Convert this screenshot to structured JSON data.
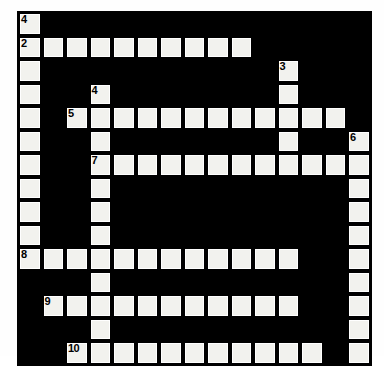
{
  "puzzle": {
    "title": "Crossword Grid",
    "rows": 15,
    "cols": 15,
    "cell_size_px": 23.5,
    "colors": {
      "block": "#000000",
      "open": "#f2f2ee",
      "page_background": "#ffffff",
      "number_text": "#000000"
    },
    "clue_numbers_visible": [
      "4",
      "2",
      "3",
      "4",
      "5",
      "6",
      "7",
      "8",
      "9",
      "10"
    ],
    "grid": [
      [
        {
          "type": "open",
          "number": "4"
        },
        {
          "type": "block"
        },
        {
          "type": "block"
        },
        {
          "type": "block"
        },
        {
          "type": "block"
        },
        {
          "type": "block"
        },
        {
          "type": "block"
        },
        {
          "type": "block"
        },
        {
          "type": "block"
        },
        {
          "type": "block"
        },
        {
          "type": "block"
        },
        {
          "type": "block"
        },
        {
          "type": "block"
        },
        {
          "type": "block"
        },
        {
          "type": "block"
        }
      ],
      [
        {
          "type": "open",
          "number": "2"
        },
        {
          "type": "open"
        },
        {
          "type": "open"
        },
        {
          "type": "open"
        },
        {
          "type": "open"
        },
        {
          "type": "open"
        },
        {
          "type": "open"
        },
        {
          "type": "open"
        },
        {
          "type": "open"
        },
        {
          "type": "open"
        },
        {
          "type": "block"
        },
        {
          "type": "block"
        },
        {
          "type": "block"
        },
        {
          "type": "block"
        },
        {
          "type": "block"
        }
      ],
      [
        {
          "type": "open"
        },
        {
          "type": "block"
        },
        {
          "type": "block"
        },
        {
          "type": "block"
        },
        {
          "type": "block"
        },
        {
          "type": "block"
        },
        {
          "type": "block"
        },
        {
          "type": "block"
        },
        {
          "type": "block"
        },
        {
          "type": "block"
        },
        {
          "type": "block"
        },
        {
          "type": "open",
          "number": "3"
        },
        {
          "type": "block"
        },
        {
          "type": "block"
        },
        {
          "type": "block"
        }
      ],
      [
        {
          "type": "open"
        },
        {
          "type": "block"
        },
        {
          "type": "block"
        },
        {
          "type": "open",
          "number": "4"
        },
        {
          "type": "block"
        },
        {
          "type": "block"
        },
        {
          "type": "block"
        },
        {
          "type": "block"
        },
        {
          "type": "block"
        },
        {
          "type": "block"
        },
        {
          "type": "block"
        },
        {
          "type": "open"
        },
        {
          "type": "block"
        },
        {
          "type": "block"
        },
        {
          "type": "block"
        }
      ],
      [
        {
          "type": "open"
        },
        {
          "type": "block"
        },
        {
          "type": "open",
          "number": "5"
        },
        {
          "type": "open"
        },
        {
          "type": "open"
        },
        {
          "type": "open"
        },
        {
          "type": "open"
        },
        {
          "type": "open"
        },
        {
          "type": "open"
        },
        {
          "type": "open"
        },
        {
          "type": "open"
        },
        {
          "type": "open"
        },
        {
          "type": "open"
        },
        {
          "type": "open"
        },
        {
          "type": "block"
        }
      ],
      [
        {
          "type": "open"
        },
        {
          "type": "block"
        },
        {
          "type": "block"
        },
        {
          "type": "open"
        },
        {
          "type": "block"
        },
        {
          "type": "block"
        },
        {
          "type": "block"
        },
        {
          "type": "block"
        },
        {
          "type": "block"
        },
        {
          "type": "block"
        },
        {
          "type": "block"
        },
        {
          "type": "open"
        },
        {
          "type": "block"
        },
        {
          "type": "block"
        },
        {
          "type": "open",
          "number": "6"
        }
      ],
      [
        {
          "type": "open"
        },
        {
          "type": "block"
        },
        {
          "type": "block"
        },
        {
          "type": "open",
          "number": "7"
        },
        {
          "type": "open"
        },
        {
          "type": "open"
        },
        {
          "type": "open"
        },
        {
          "type": "open"
        },
        {
          "type": "open"
        },
        {
          "type": "open"
        },
        {
          "type": "open"
        },
        {
          "type": "open"
        },
        {
          "type": "open"
        },
        {
          "type": "open"
        },
        {
          "type": "open"
        }
      ],
      [
        {
          "type": "open"
        },
        {
          "type": "block"
        },
        {
          "type": "block"
        },
        {
          "type": "open"
        },
        {
          "type": "block"
        },
        {
          "type": "block"
        },
        {
          "type": "block"
        },
        {
          "type": "block"
        },
        {
          "type": "block"
        },
        {
          "type": "block"
        },
        {
          "type": "block"
        },
        {
          "type": "block"
        },
        {
          "type": "block"
        },
        {
          "type": "block"
        },
        {
          "type": "open"
        }
      ],
      [
        {
          "type": "open"
        },
        {
          "type": "block"
        },
        {
          "type": "block"
        },
        {
          "type": "open"
        },
        {
          "type": "block"
        },
        {
          "type": "block"
        },
        {
          "type": "block"
        },
        {
          "type": "block"
        },
        {
          "type": "block"
        },
        {
          "type": "block"
        },
        {
          "type": "block"
        },
        {
          "type": "block"
        },
        {
          "type": "block"
        },
        {
          "type": "block"
        },
        {
          "type": "open"
        }
      ],
      [
        {
          "type": "open"
        },
        {
          "type": "block"
        },
        {
          "type": "block"
        },
        {
          "type": "open"
        },
        {
          "type": "block"
        },
        {
          "type": "block"
        },
        {
          "type": "block"
        },
        {
          "type": "block"
        },
        {
          "type": "block"
        },
        {
          "type": "block"
        },
        {
          "type": "block"
        },
        {
          "type": "block"
        },
        {
          "type": "block"
        },
        {
          "type": "block"
        },
        {
          "type": "open"
        }
      ],
      [
        {
          "type": "open",
          "number": "8"
        },
        {
          "type": "open"
        },
        {
          "type": "open"
        },
        {
          "type": "open"
        },
        {
          "type": "open"
        },
        {
          "type": "open"
        },
        {
          "type": "open"
        },
        {
          "type": "open"
        },
        {
          "type": "open"
        },
        {
          "type": "open"
        },
        {
          "type": "open"
        },
        {
          "type": "open"
        },
        {
          "type": "block"
        },
        {
          "type": "block"
        },
        {
          "type": "open"
        }
      ],
      [
        {
          "type": "block"
        },
        {
          "type": "block"
        },
        {
          "type": "block"
        },
        {
          "type": "open"
        },
        {
          "type": "block"
        },
        {
          "type": "block"
        },
        {
          "type": "block"
        },
        {
          "type": "block"
        },
        {
          "type": "block"
        },
        {
          "type": "block"
        },
        {
          "type": "block"
        },
        {
          "type": "block"
        },
        {
          "type": "block"
        },
        {
          "type": "block"
        },
        {
          "type": "open"
        }
      ],
      [
        {
          "type": "block"
        },
        {
          "type": "open",
          "number": "9"
        },
        {
          "type": "open"
        },
        {
          "type": "open"
        },
        {
          "type": "open"
        },
        {
          "type": "open"
        },
        {
          "type": "open"
        },
        {
          "type": "open"
        },
        {
          "type": "open"
        },
        {
          "type": "open"
        },
        {
          "type": "open"
        },
        {
          "type": "open"
        },
        {
          "type": "block"
        },
        {
          "type": "block"
        },
        {
          "type": "open"
        }
      ],
      [
        {
          "type": "block"
        },
        {
          "type": "block"
        },
        {
          "type": "block"
        },
        {
          "type": "open"
        },
        {
          "type": "block"
        },
        {
          "type": "block"
        },
        {
          "type": "block"
        },
        {
          "type": "block"
        },
        {
          "type": "block"
        },
        {
          "type": "block"
        },
        {
          "type": "block"
        },
        {
          "type": "block"
        },
        {
          "type": "block"
        },
        {
          "type": "block"
        },
        {
          "type": "open"
        }
      ],
      [
        {
          "type": "block"
        },
        {
          "type": "block"
        },
        {
          "type": "open",
          "number": "10"
        },
        {
          "type": "open"
        },
        {
          "type": "open"
        },
        {
          "type": "open"
        },
        {
          "type": "open"
        },
        {
          "type": "open"
        },
        {
          "type": "open"
        },
        {
          "type": "open"
        },
        {
          "type": "open"
        },
        {
          "type": "open"
        },
        {
          "type": "open"
        },
        {
          "type": "block"
        },
        {
          "type": "open"
        }
      ]
    ]
  }
}
